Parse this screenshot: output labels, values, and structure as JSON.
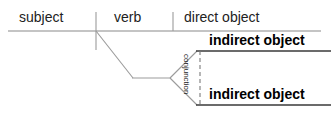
{
  "diagram": {
    "type": "sentence-diagram",
    "line_color": "#999999",
    "baseline_color": "#8a8a8a",
    "text_color": "#111111",
    "background": "#ffffff",
    "labels": {
      "subject": "subject",
      "verb": "verb",
      "direct_object": "direct object",
      "indirect_object_1": "indirect object",
      "indirect_object_2": "indirect object",
      "conjunction": "conjunction"
    },
    "geometry": {
      "main_baseline": {
        "x1": 8,
        "y1": 31,
        "x2": 321,
        "y2": 31
      },
      "subject_verb_divider": {
        "x1": 96,
        "y1": 12,
        "x2": 96,
        "y2": 50
      },
      "verb_object_divider": {
        "x1": 173,
        "y1": 12,
        "x2": 173,
        "y2": 31
      },
      "slant_from_verb": {
        "x1": 96,
        "y1": 31,
        "x2": 133,
        "y2": 78
      },
      "horizontal_stem": {
        "x1": 133,
        "y1": 78,
        "x2": 170,
        "y2": 78
      },
      "fork_upper": {
        "x1": 170,
        "y1": 78,
        "x2": 196,
        "y2": 51
      },
      "fork_lower": {
        "x1": 170,
        "y1": 78,
        "x2": 196,
        "y2": 105
      },
      "indirect_object_1_line": {
        "x1": 196,
        "y1": 51,
        "x2": 330,
        "y2": 51
      },
      "indirect_object_2_line": {
        "x1": 196,
        "y1": 105,
        "x2": 330,
        "y2": 105
      },
      "conjunction_dashed_line": {
        "x1": 200,
        "y1": 51,
        "x2": 200,
        "y2": 105
      }
    }
  }
}
